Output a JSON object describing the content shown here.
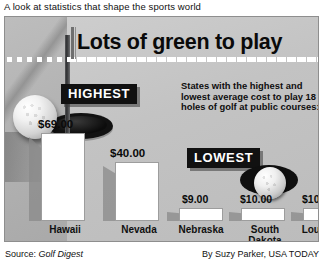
{
  "kicker": "A look at statistics that shape the sports world",
  "headline": "Lots of green to play",
  "badges": {
    "highest": "HIGHEST",
    "lowest": "LOWEST"
  },
  "blurb": "States with the highest and lowest average cost to play 18 holes of golf at public courses:",
  "footer": {
    "source_prefix": "Source: ",
    "source_name": "Golf Digest",
    "credit": "By Suzy Parker, USA TODAY"
  },
  "chart_data": {
    "type": "bar",
    "title": "Lots of green to play",
    "subtitle": "States with the highest and lowest average cost to play 18 holes of golf at public courses:",
    "categories": [
      "Hawaii",
      "Nevada",
      "Nebraska",
      "South Dakota",
      "Louisiana"
    ],
    "values": [
      69.0,
      40.0,
      9.0,
      10.0,
      10.0
    ],
    "value_labels": [
      "$69.00",
      "$40.00",
      "$9.00",
      "$10.00",
      "$10.00"
    ],
    "xlabel": "",
    "ylabel": "Average cost (US$)",
    "ylim": [
      0,
      75
    ],
    "grid": false,
    "legend": "none",
    "groups": [
      {
        "name": "HIGHEST",
        "categories": [
          "Hawaii",
          "Nevada"
        ]
      },
      {
        "name": "LOWEST",
        "categories": [
          "Nebraska",
          "South Dakota",
          "Louisiana"
        ]
      }
    ],
    "source": "Golf Digest",
    "credit": "By Suzy Parker, USA TODAY"
  },
  "bars": [
    {
      "label": "Hawaii",
      "label2": "",
      "value_label": "$69.00",
      "x": 36,
      "width": 44,
      "height": 88,
      "label_x": 32,
      "value_x": 33
    },
    {
      "label": "Nevada",
      "label2": "",
      "value_label": "$40.00",
      "x": 110,
      "width": 44,
      "height": 59,
      "label_x": 106,
      "value_x": 105
    },
    {
      "label": "Nebraska",
      "label2": "",
      "value_label": "$9.00",
      "x": 174,
      "width": 44,
      "height": 13,
      "label_x": 168,
      "value_x": 177
    },
    {
      "label": "South",
      "label2": "Dakota",
      "value_label": "$10.00",
      "x": 236,
      "width": 44,
      "height": 13,
      "label_x": 232,
      "value_x": 235
    },
    {
      "label": "Louisiana",
      "label2": "",
      "value_label": "$10.00",
      "x": 298,
      "width": 44,
      "height": 13,
      "label_x": 292,
      "value_x": 297
    }
  ],
  "colors": {
    "panel_bg": "#c2c2c2",
    "bar_fill": "#ffffff",
    "bar_shadow": "#8a8a8a",
    "badge_bg": "#111111",
    "badge_text": "#ffffff",
    "text": "#0a0a0a"
  },
  "icons": {
    "golf_ball_large": "golf-ball-icon",
    "golf_ball_small": "golf-ball-icon",
    "hole_large": "golf-hole-icon",
    "hole_small": "golf-hole-icon",
    "flagstick": "flagstick-icon"
  }
}
